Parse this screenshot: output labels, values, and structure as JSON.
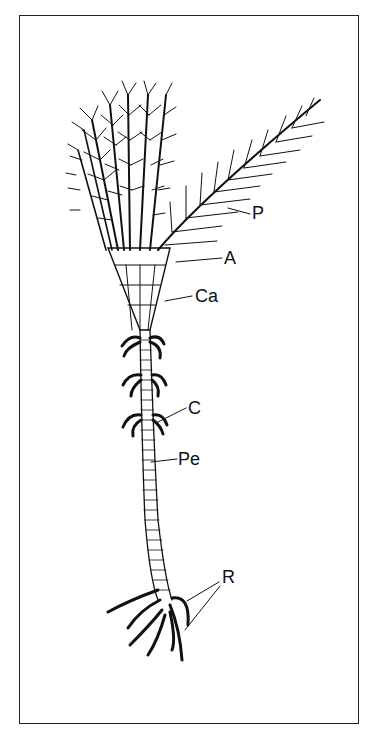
{
  "figure": {
    "labels": [
      {
        "id": "P",
        "text": "P",
        "x": 252,
        "y": 204
      },
      {
        "id": "A",
        "text": "A",
        "x": 224,
        "y": 249
      },
      {
        "id": "Ca",
        "text": "Ca",
        "x": 195,
        "y": 287
      },
      {
        "id": "C",
        "text": "C",
        "x": 188,
        "y": 399
      },
      {
        "id": "Pe",
        "text": "Pe",
        "x": 178,
        "y": 450
      },
      {
        "id": "R",
        "text": "R",
        "x": 222,
        "y": 568
      }
    ]
  }
}
